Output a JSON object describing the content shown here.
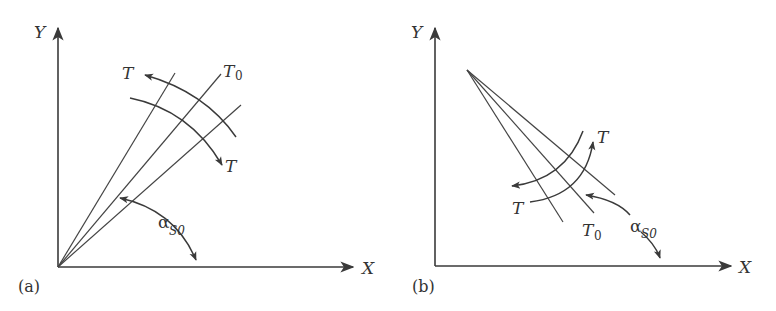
{
  "figure": {
    "panels": [
      {
        "id": "a",
        "label": "(a)",
        "x_axis_label": "X",
        "y_axis_label": "Y",
        "rays": [
          "T (left)",
          "T0 (middle)",
          "T (right)"
        ],
        "labels": {
          "t_upper": "T",
          "t0": "T",
          "t0_sub": "0",
          "t_lower": "T",
          "alpha": "α",
          "alpha_sub": "S0"
        }
      },
      {
        "id": "b",
        "label": "(b)",
        "x_axis_label": "X",
        "y_axis_label": "Y",
        "labels": {
          "t_upper": "T",
          "t_lower": "T",
          "t0": "T",
          "t0_sub": "0",
          "alpha": "α",
          "alpha_sub": "S0"
        }
      }
    ],
    "colors": {
      "line": "#3a3a3a",
      "text": "#333333",
      "background": "#ffffff"
    }
  }
}
